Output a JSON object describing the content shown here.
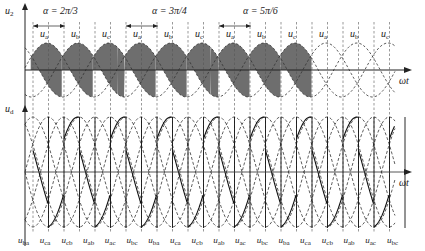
{
  "top_panel": {
    "y_axis_label": "u",
    "y_axis_sub": "2",
    "x_axis_label": "ωt",
    "fill_color": "#6e6e6e",
    "phase_labels": [
      "a",
      "b",
      "c",
      "a",
      "b",
      "c",
      "a",
      "b",
      "c",
      "a",
      "b",
      "c"
    ],
    "alpha_annotations": [
      {
        "text": "α = 2π/3",
        "x": 43
      },
      {
        "text": "α = 3π/4",
        "x": 152
      },
      {
        "text": "α = 5π/6",
        "x": 243
      }
    ]
  },
  "bottom_panel": {
    "y_axis_label": "u",
    "y_axis_sub": "d",
    "x_axis_label": "ωt",
    "line_voltage_labels": [
      "ba",
      "ca",
      "cb",
      "ab",
      "ac",
      "bc",
      "ba",
      "ca",
      "cb",
      "ab",
      "ac",
      "bc",
      "ba",
      "ca",
      "cb",
      "ab",
      "ac",
      "bc"
    ]
  },
  "geometry": {
    "x0": 25,
    "period": 93,
    "top_axis_y": 70,
    "top_amp": 27,
    "bot_axis_y": 172,
    "bot_amp": 55,
    "x_end": 395
  }
}
